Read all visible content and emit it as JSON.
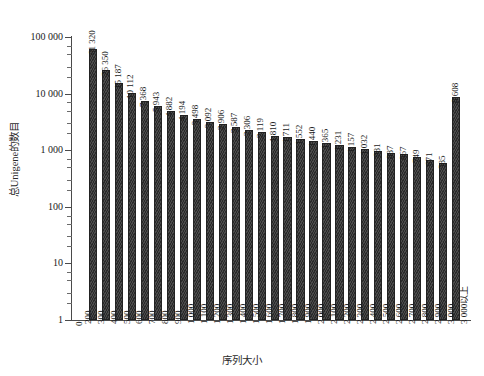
{
  "chart_data": {
    "type": "bar",
    "title": "",
    "xlabel": "序列大小",
    "ylabel": "总Unigene的数目",
    "yscale": "log",
    "ylim": [
      1,
      100000
    ],
    "ytick_labels": [
      "1",
      "10",
      "100",
      "1 000",
      "10 000",
      "100 000"
    ],
    "ytick_values": [
      1,
      10,
      100,
      1000,
      10000,
      100000
    ],
    "grid": false,
    "legend": null,
    "categories": [
      "200",
      "300",
      "400",
      "500",
      "600",
      "700",
      "800",
      "900",
      "1 000",
      "1 100",
      "1 200",
      "1 300",
      "1 400",
      "1 500",
      "1 600",
      "1 700",
      "1 800",
      "1 900",
      "2 000",
      "2 100",
      "2 200",
      "2 300",
      "2 400",
      "2 500",
      "2 600",
      "2 700",
      "2 800",
      "2 900",
      "3 000",
      "3 000以上"
    ],
    "values": [
      0,
      61320,
      26350,
      15187,
      10112,
      7368,
      5943,
      4882,
      4194,
      3498,
      3092,
      2906,
      2587,
      2306,
      2119,
      1810,
      1711,
      1552,
      1440,
      1365,
      1231,
      1157,
      1032,
      981,
      887,
      867,
      749,
      671,
      585,
      8608
    ],
    "value_labels": [
      "0",
      "61 320",
      "26 350",
      "15 187",
      "10 112",
      "7 368",
      "5 943",
      "4 882",
      "4 194",
      "3 498",
      "3 092",
      "2 906",
      "2 587",
      "2 306",
      "2 119",
      "1 810",
      "1 711",
      "1 552",
      "1 440",
      "1 365",
      "1 231",
      "1 157",
      "1 032",
      "981",
      "887",
      "867",
      "749",
      "671",
      "585",
      "8 608"
    ],
    "bar_color": "#333333"
  },
  "caption": ""
}
